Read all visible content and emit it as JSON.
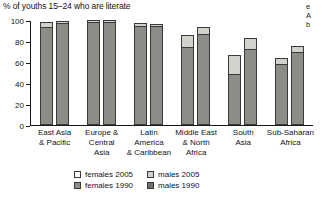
{
  "title": "% of youths 15–24 who are literate",
  "bleed_text": [
    "e",
    "A",
    "b"
  ],
  "axis": {
    "y_ticks": [
      "0",
      "20",
      "40",
      "60",
      "80",
      "100"
    ],
    "y_min": 0,
    "y_max": 100
  },
  "legend": [
    {
      "key": "females-2005",
      "label": "females 2005",
      "swatch": "sw-light"
    },
    {
      "key": "males-2005",
      "label": "males 2005",
      "swatch": "sw-mid"
    },
    {
      "key": "females-1990",
      "label": "females 1990",
      "swatch": "sw-dark"
    },
    {
      "key": "males-1990",
      "label": "males 1990",
      "swatch": "sw-darker"
    }
  ],
  "chart_data": {
    "type": "bar",
    "title": "% of youths 15–24 who are literate",
    "xlabel": "",
    "ylabel": "",
    "ylim": [
      0,
      100
    ],
    "ytick_step": 20,
    "grid": false,
    "legend_position": "bottom",
    "stacked": "overlay-1990-base-plus-2005-increase",
    "categories": [
      "East Asia & Pacific",
      "Europe & Central Asia",
      "Latin America & Caribbean",
      "Middle East & North Africa",
      "South Asia",
      "Sub-Saharan Africa"
    ],
    "category_lines": [
      [
        "East Asia",
        "& Pacific"
      ],
      [
        "Europe &",
        "Central",
        "Asia"
      ],
      [
        "Latin",
        "America",
        "& Caribbean"
      ],
      [
        "Middle East",
        "& North",
        "Africa"
      ],
      [
        "South",
        "Asia"
      ],
      [
        "Sub-Saharan",
        "Africa"
      ]
    ],
    "series": [
      {
        "name": "females 1990",
        "values": [
          93,
          99,
          94,
          74,
          49,
          58
        ]
      },
      {
        "name": "females 2005",
        "values": [
          98,
          100,
          97,
          86,
          67,
          64
        ]
      },
      {
        "name": "males 1990",
        "values": [
          97,
          99,
          94,
          87,
          72,
          70
        ]
      },
      {
        "name": "males 2005",
        "values": [
          99,
          100,
          96,
          93,
          83,
          75
        ]
      }
    ],
    "bars": [
      {
        "category": "East Asia & Pacific",
        "females": {
          "v1990": 93,
          "v2005": 98
        },
        "males": {
          "v1990": 97,
          "v2005": 99
        }
      },
      {
        "category": "Europe & Central Asia",
        "females": {
          "v1990": 99,
          "v2005": 100
        },
        "males": {
          "v1990": 99,
          "v2005": 100
        }
      },
      {
        "category": "Latin America & Caribbean",
        "females": {
          "v1990": 94,
          "v2005": 97
        },
        "males": {
          "v1990": 94,
          "v2005": 96
        }
      },
      {
        "category": "Middle East & North Africa",
        "females": {
          "v1990": 74,
          "v2005": 86
        },
        "males": {
          "v1990": 87,
          "v2005": 93
        }
      },
      {
        "category": "South Asia",
        "females": {
          "v1990": 49,
          "v2005": 67
        },
        "males": {
          "v1990": 72,
          "v2005": 83
        }
      },
      {
        "category": "Sub-Saharan Africa",
        "females": {
          "v1990": 58,
          "v2005": 64
        },
        "males": {
          "v1990": 70,
          "v2005": 75
        }
      }
    ]
  },
  "colors": {
    "bar_1990": "#8d8d88",
    "bar_2005": "#d2d2cd",
    "outline": "#3a3a3a",
    "text": "#141414",
    "background": "#ffffff"
  }
}
